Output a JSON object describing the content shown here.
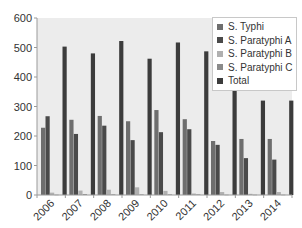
{
  "chart_data": {
    "type": "bar",
    "title": "",
    "xlabel": "",
    "ylabel": "",
    "ylim": [
      0,
      600
    ],
    "yticks": [
      0,
      100,
      200,
      300,
      400,
      500,
      600
    ],
    "grid": false,
    "legend_position": "top-right (inside)",
    "categories": [
      "2006",
      "2007",
      "2008",
      "2009",
      "2010",
      "2011",
      "2012",
      "2013",
      "2014"
    ],
    "series": [
      {
        "name": "S. Typhi",
        "color": "#6e6e6e",
        "values": [
          228,
          255,
          268,
          250,
          288,
          257,
          183,
          190,
          190
        ]
      },
      {
        "name": "S. Paratyphi A",
        "color": "#4a4a4a",
        "values": [
          267,
          207,
          235,
          186,
          213,
          223,
          170,
          125,
          120
        ]
      },
      {
        "name": "S. Paratyphi B",
        "color": "#b0b0b0",
        "values": [
          8,
          15,
          18,
          26,
          14,
          5,
          10,
          4,
          10
        ]
      },
      {
        "name": "S. Paratyphi C",
        "color": "#8a8a8a",
        "values": [
          1,
          3,
          2,
          2,
          2,
          2,
          1,
          1,
          1
        ]
      },
      {
        "name": "Total",
        "color": "#3c3c3c",
        "values": [
          503,
          480,
          522,
          462,
          517,
          487,
          362,
          320,
          320
        ]
      }
    ]
  },
  "legend": {
    "items": [
      {
        "label": "S. Typhi",
        "color": "#6e6e6e"
      },
      {
        "label": "S. Paratyphi A",
        "color": "#4a4a4a"
      },
      {
        "label": "S. Paratyphi B",
        "color": "#b0b0b0"
      },
      {
        "label": "S. Paratyphi C",
        "color": "#8a8a8a"
      },
      {
        "label": "Total",
        "color": "#3c3c3c"
      }
    ]
  },
  "colors": {
    "plot_background": "#ececec",
    "axis": "#9a9a9a"
  }
}
